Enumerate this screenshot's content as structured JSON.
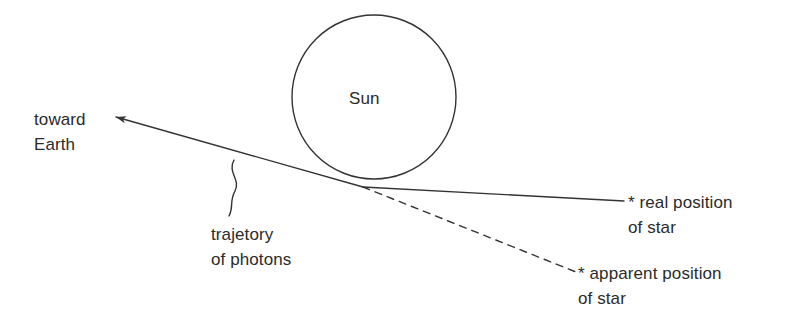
{
  "diagram": {
    "type": "physics-schematic",
    "background_color": "#ffffff",
    "stroke_color": "#333333",
    "text_color": "#2b2b2b"
  },
  "labels": {
    "sun": "Sun",
    "toward_earth_line1": "toward",
    "toward_earth_line2": "Earth",
    "trajectory_line1": "trajetory",
    "trajectory_line2": "of photons",
    "real_position_line1": "* real position",
    "real_position_line2": "of star",
    "apparent_position_line1": "* apparent position",
    "apparent_position_line2": "of star"
  },
  "shapes": {
    "sun_circle": {
      "name": "sun",
      "cx": 374,
      "cy": 97,
      "r": 82,
      "fill": "none",
      "stroke": "#333333",
      "stroke_width": 1.4
    },
    "photon_path": {
      "name": "photon-trajectory",
      "style": "solid-with-arrowhead",
      "arrow_tip_x": 111,
      "arrow_tip_y": 116,
      "bend_x": 363,
      "bend_y": 187,
      "stroke": "#333333",
      "stroke_width": 1.4
    },
    "real_position_line": {
      "name": "real-position-ray",
      "style": "solid",
      "x1": 363,
      "y1": 187,
      "x2": 624,
      "y2": 201,
      "stroke": "#333333",
      "stroke_width": 1.4
    },
    "apparent_position_line": {
      "name": "apparent-position-ray",
      "style": "dashed",
      "x1": 363,
      "y1": 187,
      "x2": 576,
      "y2": 272,
      "stroke": "#333333",
      "stroke_width": 1.4,
      "dash_pattern": "7 6"
    },
    "trajectory_leader": {
      "name": "wavy-leader-line",
      "style": "s-curve",
      "top_x": 233,
      "top_y": 160,
      "bottom_x": 230,
      "bottom_y": 216,
      "stroke": "#333333",
      "stroke_width": 1.4
    }
  }
}
